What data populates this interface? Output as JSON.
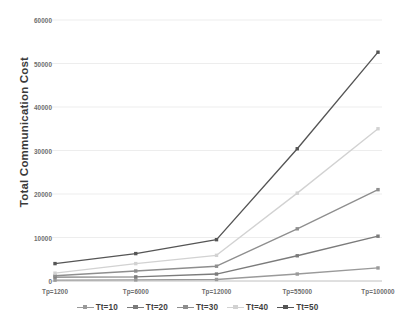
{
  "chart_data": {
    "type": "line",
    "title": "",
    "xlabel": "",
    "ylabel": "Total Communication Cost",
    "categories": [
      "Tp=1200",
      "Tp=6000",
      "Tp=12000",
      "Tp=55000",
      "Tp=100000"
    ],
    "ylim": [
      0,
      60000
    ],
    "yticks": [
      0,
      10000,
      20000,
      30000,
      40000,
      50000,
      60000
    ],
    "ytick_labels": [
      "0",
      "10000",
      "20000",
      "30000",
      "40000",
      "50000",
      "60000"
    ],
    "grid": true,
    "legend_position": "bottom",
    "series": [
      {
        "name": "Tt=10",
        "color": "#9a9a9a",
        "values": [
          200,
          250,
          350,
          1600,
          3000
        ]
      },
      {
        "name": "Tt=20",
        "color": "#7b7b7b",
        "values": [
          900,
          950,
          1600,
          5800,
          10300
        ]
      },
      {
        "name": "Tt=30",
        "color": "#8e8e8e",
        "values": [
          1200,
          2300,
          3400,
          12000,
          21000
        ]
      },
      {
        "name": "Tt=40",
        "color": "#d2d2d2",
        "values": [
          1800,
          4000,
          5900,
          20200,
          35000
        ]
      },
      {
        "name": "Tt=50",
        "color": "#555555",
        "values": [
          4000,
          6300,
          9500,
          30400,
          52600
        ]
      }
    ]
  },
  "axis": {
    "y_title": "Total Communication Cost"
  }
}
